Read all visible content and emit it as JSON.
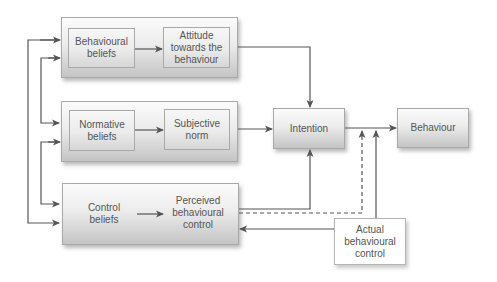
{
  "diagram": {
    "type": "flow-diagram",
    "colors": {
      "line": "#555555",
      "text": "#555555",
      "box_top": "#fbfbfb",
      "box_bottom": "#c4c4c4",
      "border": "#a9a9a9"
    },
    "groups": [
      {
        "id": "behavioural-group",
        "left": {
          "id": "behavioural-beliefs",
          "label": "Behavioural\nbeliefs"
        },
        "right": {
          "id": "attitude",
          "label": "Attitude\ntowards the\nbehaviour"
        }
      },
      {
        "id": "normative-group",
        "left": {
          "id": "normative-beliefs",
          "label": "Normative\nbeliefs"
        },
        "right": {
          "id": "subjective-norm",
          "label": "Subjective\nnorm"
        }
      },
      {
        "id": "control-group",
        "left": {
          "id": "control-beliefs",
          "label": "Control\nbeliefs"
        },
        "right": {
          "id": "perceived-control",
          "label": "Perceived\nbehavioural\ncontrol"
        }
      }
    ],
    "nodes": {
      "intention": {
        "label": "Intention"
      },
      "behaviour": {
        "label": "Behaviour"
      },
      "actual_control": {
        "label": "Actual\nbehavioural\ncontrol"
      }
    },
    "edges": [
      {
        "from": "behavioural-beliefs",
        "to": "attitude",
        "style": "solid"
      },
      {
        "from": "normative-beliefs",
        "to": "subjective-norm",
        "style": "solid"
      },
      {
        "from": "control-beliefs",
        "to": "perceived-control",
        "style": "solid"
      },
      {
        "from": "attitude",
        "to": "intention",
        "style": "solid"
      },
      {
        "from": "subjective-norm",
        "to": "intention",
        "style": "solid"
      },
      {
        "from": "perceived-control",
        "to": "intention",
        "style": "solid"
      },
      {
        "from": "perceived-control",
        "to": "behaviour",
        "style": "dashed"
      },
      {
        "from": "intention",
        "to": "behaviour",
        "style": "solid"
      },
      {
        "from": "actual_control",
        "to": "behaviour",
        "style": "solid"
      },
      {
        "from": "actual_control",
        "to": "perceived-control",
        "style": "solid"
      },
      {
        "from": "behavioural-group",
        "to": "control-group",
        "style": "solid",
        "kind": "bidirectional-feedback"
      },
      {
        "from": "behavioural-group",
        "to": "normative-group",
        "style": "solid",
        "kind": "bidirectional-feedback"
      },
      {
        "from": "normative-group",
        "to": "control-group",
        "style": "solid",
        "kind": "bidirectional-feedback"
      }
    ]
  }
}
